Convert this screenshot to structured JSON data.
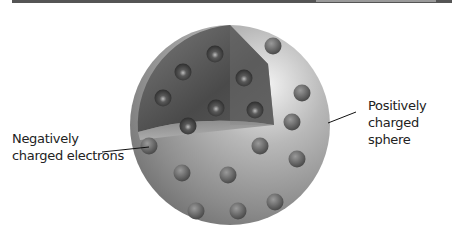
{
  "diagram": {
    "title": "",
    "labels": {
      "electrons": {
        "line1": "Negatively",
        "line2": "charged electrons"
      },
      "sphere": {
        "line1": "Positively",
        "line2": "charged sphere"
      }
    },
    "colors": {
      "sphere_dark": "#4a4a4a",
      "sphere_light": "#e6e6e6",
      "electron": "#3e3e3e",
      "text": "#222222"
    },
    "electrons": [
      [
        215,
        54
      ],
      [
        183,
        72
      ],
      [
        244,
        78
      ],
      [
        163,
        98
      ],
      [
        216,
        108
      ],
      [
        255,
        110
      ],
      [
        188,
        126
      ],
      [
        273,
        46
      ],
      [
        302,
        93
      ],
      [
        292,
        122
      ],
      [
        149,
        146
      ],
      [
        260,
        146
      ],
      [
        297,
        159
      ],
      [
        182,
        173
      ],
      [
        228,
        175
      ],
      [
        196,
        211
      ],
      [
        238,
        211
      ],
      [
        275,
        202
      ]
    ]
  }
}
